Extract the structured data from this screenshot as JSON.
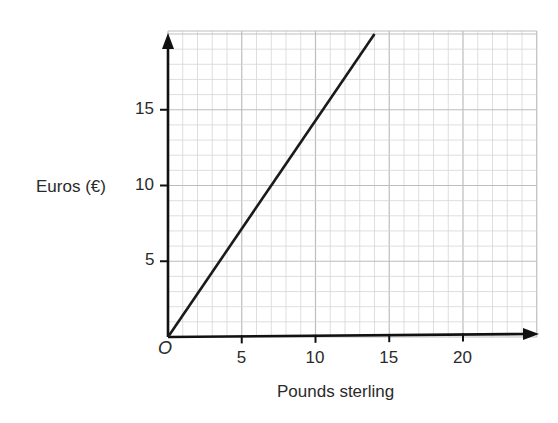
{
  "chart_data": {
    "type": "line",
    "title": "",
    "xlabel": "Pounds sterling",
    "ylabel": "Euros (€)",
    "origin_label": "O",
    "xlim": [
      0,
      25
    ],
    "ylim": [
      0,
      20
    ],
    "x_ticks": [
      5,
      10,
      15,
      20
    ],
    "y_ticks": [
      5,
      10,
      15
    ],
    "x_tick_labels": [
      "5",
      "10",
      "15",
      "20"
    ],
    "y_tick_labels": [
      "5",
      "10",
      "15"
    ],
    "grid": true,
    "grid_minor_step": 1,
    "grid_major_step": 5,
    "legend": null,
    "series": [
      {
        "name": "Conversion line",
        "x": [
          0,
          7,
          14
        ],
        "y": [
          0,
          10,
          20
        ],
        "color": "#1a1a1a"
      }
    ]
  },
  "colors": {
    "axis": "#111111",
    "grid_minor": "#d6d6d6",
    "grid_major": "#bdbdbd",
    "line": "#1a1a1a"
  }
}
